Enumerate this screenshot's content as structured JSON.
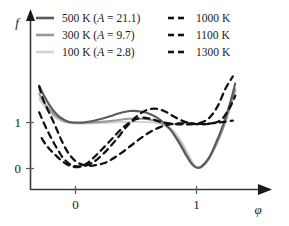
{
  "chart_data": {
    "type": "line",
    "title": "",
    "xlabel": "φ",
    "ylabel": "f",
    "xlim": [
      -0.42,
      1.42
    ],
    "ylim": [
      -0.35,
      2.05
    ],
    "xticks": [
      0,
      1
    ],
    "xtick_labels": [
      "0",
      "1"
    ],
    "yticks": [
      0,
      1
    ],
    "ytick_labels": [
      "0",
      "1"
    ],
    "grid": false,
    "legend_position": "top",
    "legend_columns": 2,
    "series": [
      {
        "name": "500 K (A = 21.1)",
        "temperature_K": 500,
        "A": 21.1,
        "style": "solid",
        "color": "#5a5a5a",
        "x": [
          -0.3,
          -0.26,
          -0.22,
          -0.18,
          -0.14,
          -0.1,
          -0.05,
          0.0,
          0.06,
          0.12,
          0.2,
          0.28,
          0.36,
          0.45,
          0.54,
          0.62,
          0.7,
          0.78,
          0.86,
          0.92,
          0.96,
          1.0,
          1.04,
          1.1,
          1.16,
          1.22,
          1.28,
          1.32
        ],
        "y": [
          1.8,
          1.58,
          1.4,
          1.25,
          1.14,
          1.07,
          1.01,
          1.0,
          1.0,
          1.02,
          1.07,
          1.13,
          1.2,
          1.25,
          1.24,
          1.18,
          1.06,
          0.86,
          0.54,
          0.26,
          0.1,
          0.02,
          0.04,
          0.22,
          0.55,
          0.95,
          1.45,
          1.85
        ]
      },
      {
        "name": "300 K (A = 9.7)",
        "temperature_K": 300,
        "A": 9.7,
        "style": "solid",
        "color": "#9a9a9a",
        "x": [
          -0.3,
          -0.26,
          -0.22,
          -0.18,
          -0.14,
          -0.1,
          -0.05,
          0.0,
          0.06,
          0.14,
          0.24,
          0.34,
          0.44,
          0.54,
          0.62,
          0.7,
          0.78,
          0.86,
          0.92,
          0.96,
          1.0,
          1.04,
          1.1,
          1.16,
          1.22,
          1.28,
          1.32
        ],
        "y": [
          1.62,
          1.44,
          1.3,
          1.18,
          1.1,
          1.04,
          1.0,
          0.99,
          0.99,
          1.0,
          1.02,
          1.05,
          1.08,
          1.08,
          1.06,
          1.0,
          0.86,
          0.58,
          0.3,
          0.12,
          0.02,
          0.03,
          0.2,
          0.5,
          0.88,
          1.35,
          1.72
        ]
      },
      {
        "name": "100 K (A = 2.8)",
        "temperature_K": 100,
        "A": 2.8,
        "style": "solid",
        "color": "#d2d2d2",
        "x": [
          -0.3,
          -0.26,
          -0.22,
          -0.18,
          -0.14,
          -0.1,
          -0.05,
          0.0,
          0.08,
          0.18,
          0.3,
          0.42,
          0.54,
          0.64,
          0.72,
          0.8,
          0.87,
          0.93,
          0.97,
          1.0,
          1.04,
          1.1,
          1.16,
          1.22,
          1.28,
          1.32
        ],
        "y": [
          1.52,
          1.36,
          1.24,
          1.14,
          1.07,
          1.02,
          0.99,
          0.98,
          0.98,
          0.99,
          1.0,
          1.01,
          1.01,
          1.0,
          0.96,
          0.84,
          0.6,
          0.32,
          0.12,
          0.02,
          0.04,
          0.22,
          0.52,
          0.9,
          1.36,
          1.7
        ]
      },
      {
        "name": "1000 K",
        "temperature_K": 1000,
        "style": "dashed",
        "color": "#111111",
        "x": [
          -0.28,
          -0.24,
          -0.2,
          -0.16,
          -0.12,
          -0.07,
          -0.02,
          0.04,
          0.1,
          0.16,
          0.22,
          0.3,
          0.38,
          0.46,
          0.54,
          0.62,
          0.7,
          0.78,
          0.86,
          0.94,
          1.0,
          1.06,
          1.12,
          1.18,
          1.24,
          1.3
        ],
        "y": [
          0.66,
          0.5,
          0.38,
          0.28,
          0.18,
          0.09,
          0.04,
          0.04,
          0.12,
          0.26,
          0.42,
          0.64,
          0.86,
          1.02,
          1.1,
          1.08,
          1.02,
          0.98,
          0.96,
          0.96,
          0.97,
          0.97,
          0.98,
          1.0,
          1.02,
          1.04
        ]
      },
      {
        "name": "1100 K",
        "temperature_K": 1100,
        "style": "dashed",
        "color": "#111111",
        "x": [
          -0.3,
          -0.26,
          -0.22,
          -0.18,
          -0.14,
          -0.1,
          -0.05,
          0.0,
          0.06,
          0.12,
          0.18,
          0.26,
          0.34,
          0.42,
          0.5,
          0.58,
          0.66,
          0.74,
          0.82,
          0.9,
          0.98,
          1.04,
          1.1,
          1.16,
          1.22,
          1.28,
          1.32
        ],
        "y": [
          1.22,
          0.98,
          0.76,
          0.56,
          0.38,
          0.22,
          0.1,
          0.05,
          0.05,
          0.1,
          0.2,
          0.4,
          0.64,
          0.9,
          1.12,
          1.26,
          1.3,
          1.24,
          1.12,
          1.02,
          0.97,
          0.96,
          0.97,
          1.0,
          1.1,
          1.35,
          1.58
        ]
      },
      {
        "name": "1300 K",
        "temperature_K": 1300,
        "style": "dashed",
        "color": "#111111",
        "x": [
          -0.3,
          -0.27,
          -0.23,
          -0.19,
          -0.15,
          -0.11,
          -0.06,
          0.0,
          0.06,
          0.12,
          0.18,
          0.24,
          0.3,
          0.38,
          0.46,
          0.54,
          0.62,
          0.7,
          0.78,
          0.86,
          0.94,
          1.0,
          1.06,
          1.12,
          1.18,
          1.24,
          1.3
        ],
        "y": [
          1.78,
          1.52,
          1.28,
          1.06,
          0.82,
          0.58,
          0.34,
          0.16,
          0.08,
          0.06,
          0.08,
          0.12,
          0.2,
          0.34,
          0.5,
          0.66,
          0.8,
          0.9,
          0.96,
          0.98,
          0.98,
          0.98,
          1.02,
          1.14,
          1.38,
          1.74,
          2.0
        ]
      }
    ]
  },
  "axes": {
    "y_label": "f",
    "x_label": "φ",
    "x_tick_0": "0",
    "x_tick_1": "1",
    "y_tick_0": "0",
    "y_tick_1": "1"
  },
  "legend": {
    "entries": [
      {
        "label": "500 K (A = 21.1)",
        "pre": "500 K (",
        "sym": "A",
        "post": " = 21.1)",
        "style": "solid",
        "color": "#5a5a5a"
      },
      {
        "label": "1000 K",
        "pre": "1000 K",
        "sym": "",
        "post": "",
        "style": "dashed",
        "color": "#111111"
      },
      {
        "label": "300 K (A = 9.7)",
        "pre": "300 K (",
        "sym": "A",
        "post": " = 9.7)",
        "style": "solid",
        "color": "#9a9a9a"
      },
      {
        "label": "1100 K",
        "pre": "1100 K",
        "sym": "",
        "post": "",
        "style": "dashed",
        "color": "#111111"
      },
      {
        "label": "100 K (A = 2.8)",
        "pre": "100 K (",
        "sym": "A",
        "post": " = 2.8)",
        "style": "solid",
        "color": "#d2d2d2"
      },
      {
        "label": "1300 K",
        "pre": "1300 K",
        "sym": "",
        "post": "",
        "style": "dashed",
        "color": "#111111"
      }
    ]
  },
  "colors": {
    "axis": "#3a3a3a",
    "text": "#1a1a1a",
    "background": "#ffffff"
  }
}
